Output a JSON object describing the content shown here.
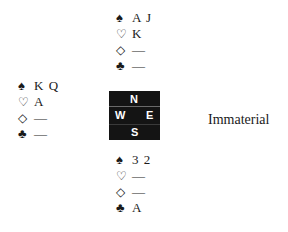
{
  "north": {
    "spades": "A J",
    "hearts": "K",
    "diamonds": "—",
    "clubs": "—"
  },
  "west": {
    "spades": "K Q",
    "hearts": "A",
    "diamonds": "—",
    "clubs": "—"
  },
  "south": {
    "spades": "3 2",
    "hearts": "—",
    "diamonds": "—",
    "clubs": "A"
  },
  "east": {
    "label": "Immaterial"
  },
  "compass": {
    "n": "N",
    "w": "W",
    "e": "E",
    "s": "S"
  },
  "suits": {
    "spade": "♠",
    "heart": "♡",
    "diamond": "◇",
    "club": "♣"
  }
}
